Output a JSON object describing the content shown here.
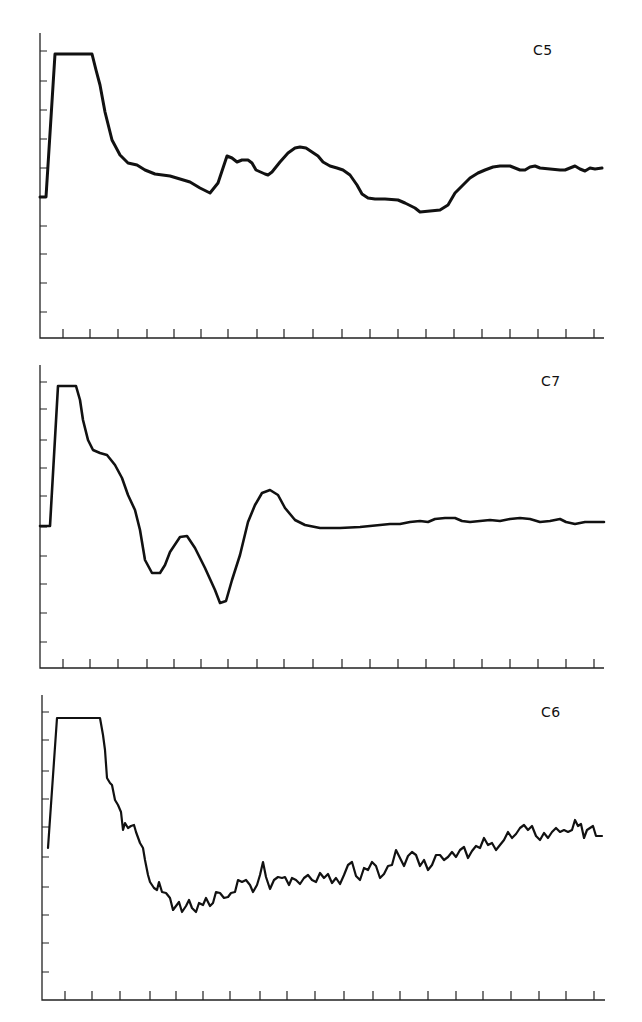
{
  "chart_data": [
    {
      "type": "line",
      "title": "C5",
      "xlabel": "",
      "ylabel": "",
      "x_tick_count": 20,
      "y_tick_count": 10,
      "grid": false,
      "legend": null,
      "frame": {
        "x0": 40,
        "y_top": 33,
        "x_end": 604,
        "y_axis": 338
      },
      "y_ticks_px": [
        51,
        81,
        110,
        139,
        168,
        197,
        226,
        254,
        283,
        312
      ],
      "x_ticks_px": [
        63,
        90,
        118,
        147,
        174,
        201,
        228,
        257,
        284,
        313,
        342,
        370,
        398,
        426,
        454,
        482,
        510,
        538,
        566,
        594
      ],
      "label_pos": {
        "x": 533,
        "y": 42
      },
      "stroke_width": 3,
      "points": [
        [
          40,
          197
        ],
        [
          46,
          197
        ],
        [
          55,
          54
        ],
        [
          92,
          54
        ],
        [
          96,
          70
        ],
        [
          100,
          85
        ],
        [
          105,
          112
        ],
        [
          112,
          140
        ],
        [
          120,
          155
        ],
        [
          128,
          163
        ],
        [
          137,
          165
        ],
        [
          145,
          170
        ],
        [
          155,
          174
        ],
        [
          170,
          176
        ],
        [
          180,
          179
        ],
        [
          190,
          182
        ],
        [
          200,
          188
        ],
        [
          210,
          193
        ],
        [
          218,
          183
        ],
        [
          223,
          168
        ],
        [
          227,
          156
        ],
        [
          232,
          158
        ],
        [
          237,
          162
        ],
        [
          242,
          160
        ],
        [
          248,
          160
        ],
        [
          252,
          163
        ],
        [
          256,
          170
        ],
        [
          265,
          174
        ],
        [
          268,
          175
        ],
        [
          272,
          172
        ],
        [
          280,
          162
        ],
        [
          288,
          153
        ],
        [
          295,
          148
        ],
        [
          300,
          147
        ],
        [
          306,
          148
        ],
        [
          312,
          152
        ],
        [
          318,
          156
        ],
        [
          323,
          162
        ],
        [
          330,
          166
        ],
        [
          337,
          168
        ],
        [
          343,
          170
        ],
        [
          350,
          175
        ],
        [
          357,
          185
        ],
        [
          362,
          194
        ],
        [
          368,
          198
        ],
        [
          375,
          199
        ],
        [
          385,
          199
        ],
        [
          398,
          200
        ],
        [
          405,
          203
        ],
        [
          415,
          208
        ],
        [
          420,
          212
        ],
        [
          430,
          211
        ],
        [
          440,
          210
        ],
        [
          448,
          205
        ],
        [
          455,
          193
        ],
        [
          462,
          186
        ],
        [
          470,
          178
        ],
        [
          478,
          173
        ],
        [
          485,
          170
        ],
        [
          493,
          167
        ],
        [
          500,
          166
        ],
        [
          510,
          166
        ],
        [
          515,
          168
        ],
        [
          520,
          170
        ],
        [
          525,
          170
        ],
        [
          530,
          167
        ],
        [
          535,
          166
        ],
        [
          540,
          168
        ],
        [
          550,
          169
        ],
        [
          560,
          170
        ],
        [
          565,
          170
        ],
        [
          570,
          168
        ],
        [
          575,
          166
        ],
        [
          580,
          169
        ],
        [
          585,
          171
        ],
        [
          590,
          168
        ],
        [
          595,
          169
        ],
        [
          602,
          168
        ]
      ]
    },
    {
      "type": "line",
      "title": "C7",
      "xlabel": "",
      "ylabel": "",
      "x_tick_count": 20,
      "y_tick_count": 10,
      "grid": false,
      "legend": null,
      "frame": {
        "x0": 40,
        "y_top": 365,
        "x_end": 604,
        "y_axis": 668
      },
      "y_ticks_px": [
        382,
        409,
        440,
        468,
        496,
        527,
        556,
        584,
        613,
        642
      ],
      "x_ticks_px": [
        63,
        90,
        118,
        147,
        174,
        201,
        228,
        257,
        284,
        313,
        342,
        370,
        398,
        426,
        454,
        482,
        510,
        538,
        566,
        594
      ],
      "label_pos": {
        "x": 541,
        "y": 373
      },
      "stroke_width": 2.6,
      "points": [
        [
          40,
          526
        ],
        [
          50,
          526
        ],
        [
          58,
          386
        ],
        [
          76,
          386
        ],
        [
          80,
          400
        ],
        [
          83,
          420
        ],
        [
          88,
          440
        ],
        [
          93,
          450
        ],
        [
          100,
          453
        ],
        [
          107,
          455
        ],
        [
          115,
          465
        ],
        [
          122,
          478
        ],
        [
          128,
          495
        ],
        [
          135,
          510
        ],
        [
          140,
          530
        ],
        [
          145,
          560
        ],
        [
          152,
          573
        ],
        [
          160,
          573
        ],
        [
          165,
          565
        ],
        [
          170,
          552
        ],
        [
          180,
          537
        ],
        [
          187,
          536
        ],
        [
          195,
          548
        ],
        [
          205,
          568
        ],
        [
          215,
          590
        ],
        [
          220,
          603
        ],
        [
          226,
          601
        ],
        [
          232,
          580
        ],
        [
          240,
          555
        ],
        [
          248,
          522
        ],
        [
          255,
          505
        ],
        [
          262,
          493
        ],
        [
          270,
          490
        ],
        [
          278,
          495
        ],
        [
          285,
          508
        ],
        [
          295,
          520
        ],
        [
          305,
          525
        ],
        [
          320,
          528
        ],
        [
          340,
          528
        ],
        [
          360,
          527
        ],
        [
          370,
          526
        ],
        [
          380,
          525
        ],
        [
          390,
          524
        ],
        [
          400,
          524
        ],
        [
          410,
          522
        ],
        [
          420,
          521
        ],
        [
          428,
          522
        ],
        [
          435,
          519
        ],
        [
          445,
          518
        ],
        [
          455,
          518
        ],
        [
          462,
          521
        ],
        [
          470,
          522
        ],
        [
          480,
          521
        ],
        [
          490,
          520
        ],
        [
          500,
          521
        ],
        [
          510,
          519
        ],
        [
          520,
          518
        ],
        [
          530,
          519
        ],
        [
          540,
          522
        ],
        [
          550,
          521
        ],
        [
          560,
          519
        ],
        [
          566,
          522
        ],
        [
          575,
          524
        ],
        [
          585,
          522
        ],
        [
          595,
          522
        ],
        [
          604,
          522
        ]
      ]
    },
    {
      "type": "line",
      "title": "C6",
      "xlabel": "",
      "ylabel": "",
      "x_tick_count": 20,
      "y_tick_count": 10,
      "grid": false,
      "legend": null,
      "frame": {
        "x0": 42,
        "y_top": 695,
        "x_end": 605,
        "y_axis": 1000
      },
      "y_ticks_px": [
        712,
        740,
        771,
        799,
        827,
        857,
        887,
        915,
        943,
        972
      ],
      "x_ticks_px": [
        65,
        92,
        120,
        150,
        176,
        203,
        230,
        260,
        287,
        315,
        344,
        373,
        400,
        428,
        456,
        483,
        511,
        539,
        566,
        594
      ],
      "label_pos": {
        "x": 541,
        "y": 704
      },
      "stroke_width": 2.2,
      "points": [
        [
          48,
          848
        ],
        [
          57,
          718
        ],
        [
          100,
          718
        ],
        [
          103,
          735
        ],
        [
          105,
          750
        ],
        [
          107,
          778
        ],
        [
          110,
          783
        ],
        [
          112,
          785
        ],
        [
          115,
          800
        ],
        [
          118,
          805
        ],
        [
          121,
          812
        ],
        [
          123,
          830
        ],
        [
          125,
          823
        ],
        [
          128,
          828
        ],
        [
          131,
          826
        ],
        [
          134,
          825
        ],
        [
          136,
          832
        ],
        [
          140,
          843
        ],
        [
          143,
          848
        ],
        [
          145,
          860
        ],
        [
          148,
          875
        ],
        [
          150,
          882
        ],
        [
          154,
          888
        ],
        [
          157,
          890
        ],
        [
          159,
          882
        ],
        [
          162,
          892
        ],
        [
          166,
          893
        ],
        [
          170,
          898
        ],
        [
          173,
          910
        ],
        [
          176,
          906
        ],
        [
          179,
          902
        ],
        [
          182,
          912
        ],
        [
          186,
          906
        ],
        [
          189,
          900
        ],
        [
          192,
          908
        ],
        [
          196,
          912
        ],
        [
          199,
          903
        ],
        [
          203,
          905
        ],
        [
          206,
          898
        ],
        [
          210,
          906
        ],
        [
          213,
          903
        ],
        [
          216,
          892
        ],
        [
          220,
          893
        ],
        [
          224,
          898
        ],
        [
          228,
          897
        ],
        [
          231,
          893
        ],
        [
          235,
          892
        ],
        [
          238,
          880
        ],
        [
          242,
          882
        ],
        [
          246,
          880
        ],
        [
          250,
          885
        ],
        [
          253,
          892
        ],
        [
          257,
          885
        ],
        [
          260,
          875
        ],
        [
          263,
          862
        ],
        [
          266,
          877
        ],
        [
          270,
          889
        ],
        [
          274,
          880
        ],
        [
          278,
          877
        ],
        [
          282,
          878
        ],
        [
          285,
          877
        ],
        [
          289,
          885
        ],
        [
          292,
          878
        ],
        [
          296,
          880
        ],
        [
          300,
          884
        ],
        [
          304,
          878
        ],
        [
          308,
          875
        ],
        [
          312,
          880
        ],
        [
          316,
          882
        ],
        [
          320,
          873
        ],
        [
          324,
          878
        ],
        [
          328,
          874
        ],
        [
          332,
          883
        ],
        [
          336,
          878
        ],
        [
          340,
          884
        ],
        [
          344,
          875
        ],
        [
          348,
          865
        ],
        [
          352,
          862
        ],
        [
          356,
          876
        ],
        [
          360,
          880
        ],
        [
          364,
          868
        ],
        [
          368,
          870
        ],
        [
          372,
          862
        ],
        [
          376,
          866
        ],
        [
          380,
          878
        ],
        [
          384,
          874
        ],
        [
          388,
          866
        ],
        [
          392,
          865
        ],
        [
          396,
          850
        ],
        [
          400,
          858
        ],
        [
          404,
          866
        ],
        [
          408,
          856
        ],
        [
          412,
          852
        ],
        [
          416,
          855
        ],
        [
          420,
          866
        ],
        [
          424,
          860
        ],
        [
          428,
          870
        ],
        [
          432,
          865
        ],
        [
          436,
          855
        ],
        [
          440,
          855
        ],
        [
          444,
          860
        ],
        [
          448,
          857
        ],
        [
          452,
          852
        ],
        [
          456,
          857
        ],
        [
          460,
          850
        ],
        [
          464,
          847
        ],
        [
          468,
          858
        ],
        [
          472,
          851
        ],
        [
          476,
          846
        ],
        [
          480,
          848
        ],
        [
          484,
          838
        ],
        [
          488,
          845
        ],
        [
          492,
          843
        ],
        [
          496,
          850
        ],
        [
          500,
          845
        ],
        [
          504,
          840
        ],
        [
          508,
          832
        ],
        [
          512,
          838
        ],
        [
          516,
          834
        ],
        [
          520,
          828
        ],
        [
          524,
          825
        ],
        [
          528,
          830
        ],
        [
          532,
          826
        ],
        [
          536,
          836
        ],
        [
          540,
          840
        ],
        [
          544,
          833
        ],
        [
          548,
          838
        ],
        [
          552,
          832
        ],
        [
          556,
          828
        ],
        [
          560,
          832
        ],
        [
          564,
          830
        ],
        [
          568,
          832
        ],
        [
          572,
          830
        ],
        [
          575,
          820
        ],
        [
          578,
          826
        ],
        [
          581,
          824
        ],
        [
          584,
          838
        ],
        [
          587,
          830
        ],
        [
          590,
          828
        ],
        [
          593,
          826
        ],
        [
          596,
          836
        ],
        [
          602,
          836
        ]
      ]
    }
  ]
}
